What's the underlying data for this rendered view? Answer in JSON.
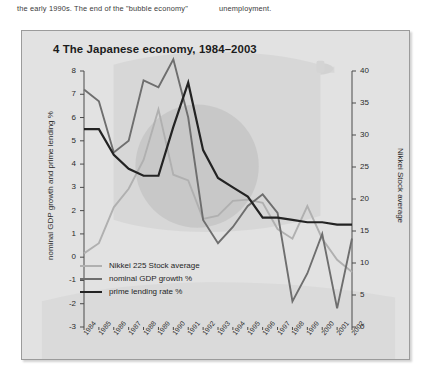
{
  "body_text": {
    "column_a": "the early 1990s. The end of the \"bubble economy\"",
    "column_b": "unemployment."
  },
  "figure": {
    "title": "4 The Japanese economy, 1984–2003",
    "background_color": "#e2e2e2",
    "border_color": "#9b9b9b"
  },
  "legend": {
    "position": "inside-lower-left",
    "items": [
      {
        "label": "Nikkei 225 Stock average",
        "color": "#b0b0b0",
        "width": 2.0
      },
      {
        "label": "nominal GDP growth %",
        "color": "#6e6e6e",
        "width": 2.0
      },
      {
        "label": "prime lending rate %",
        "color": "#232323",
        "width": 2.4
      }
    ]
  },
  "chart_data": {
    "type": "line",
    "title": "4 The Japanese economy, 1984–2003",
    "xlabel": "",
    "grid": false,
    "legend_position": "inside-lower-left",
    "x": [
      1984,
      1985,
      1986,
      1987,
      1988,
      1989,
      1990,
      1991,
      1992,
      1993,
      1994,
      1995,
      1996,
      1997,
      1998,
      1999,
      2000,
      2001,
      2002
    ],
    "x_tick_labels": [
      "1984",
      "1985",
      "1986",
      "1987",
      "1988",
      "1989",
      "1990",
      "1991",
      "1992",
      "1993",
      "1994",
      "1995",
      "1996",
      "1997",
      "1998",
      "1999",
      "2000",
      "2001",
      "2002"
    ],
    "axes": [
      {
        "side": "left",
        "ylabel": "nominal GDP growth and prime lending %",
        "ylim": [
          -3,
          8
        ],
        "ticks": [
          -3,
          -2,
          -1,
          0,
          1,
          2,
          3,
          4,
          5,
          6,
          7,
          8
        ],
        "tick_labels": [
          "-3",
          "-2",
          "-1",
          "0",
          "1",
          "2",
          "3",
          "4",
          "5",
          "6",
          "7",
          "8"
        ]
      },
      {
        "side": "right",
        "ylabel": "Nikkei Stock average",
        "ylim": [
          0,
          40
        ],
        "ticks": [
          0,
          5,
          10,
          15,
          20,
          25,
          30,
          35,
          40
        ],
        "tick_labels": [
          "0",
          "5",
          "10",
          "15",
          "20",
          "25",
          "30",
          "35",
          "40"
        ]
      }
    ],
    "series": [
      {
        "name": "Nikkei 225 Stock average",
        "axis": "right",
        "color": "#b0b0b0",
        "values": [
          11.5,
          13.1,
          18.7,
          21.6,
          26.1,
          34.0,
          23.8,
          22.9,
          16.9,
          17.4,
          19.7,
          19.9,
          19.4,
          15.3,
          13.8,
          18.9,
          13.8,
          10.5,
          8.6
        ]
      },
      {
        "name": "nominal GDP growth %",
        "axis": "left",
        "color": "#6e6e6e",
        "values": [
          7.2,
          6.7,
          4.5,
          5.0,
          7.6,
          7.3,
          8.5,
          6.0,
          1.6,
          0.6,
          1.3,
          2.2,
          2.7,
          1.9,
          -1.9,
          -0.7,
          1.0,
          -2.2,
          0.8
        ]
      },
      {
        "name": "prime lending rate %",
        "axis": "left",
        "color": "#232323",
        "values": [
          5.5,
          5.5,
          4.4,
          3.8,
          3.5,
          3.5,
          5.6,
          7.5,
          4.6,
          3.4,
          3.0,
          2.6,
          1.7,
          1.7,
          1.6,
          1.5,
          1.5,
          1.4,
          1.4
        ]
      }
    ],
    "annotations": [
      {
        "text": "Japanese flag watermark",
        "type": "background-decoration"
      }
    ]
  }
}
